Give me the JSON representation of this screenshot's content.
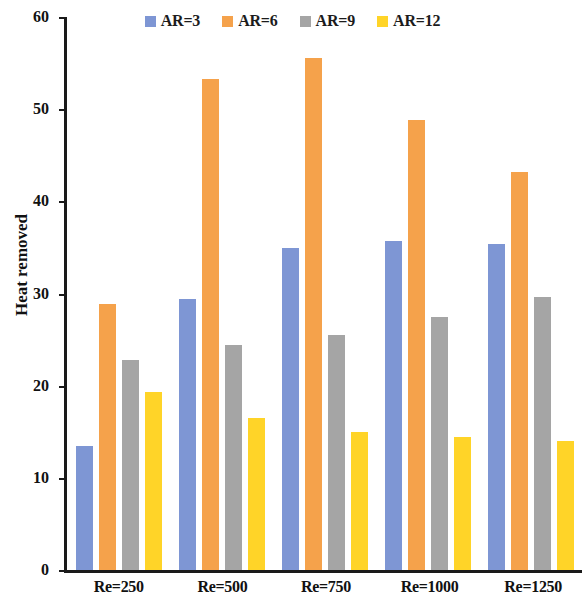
{
  "chart_data": {
    "type": "bar",
    "title": "",
    "xlabel": "",
    "ylabel": "Heat removed",
    "ylim": [
      0,
      60
    ],
    "yticks": [
      0,
      10,
      20,
      30,
      40,
      50,
      60
    ],
    "grid": false,
    "legend_position": "top-center",
    "categories": [
      "Re=250",
      "Re=500",
      "Re=750",
      "Re=1000",
      "Re=1250"
    ],
    "series": [
      {
        "name": "AR=3",
        "color": "#7E96D4",
        "values": [
          13.5,
          29.4,
          34.9,
          35.7,
          35.4
        ]
      },
      {
        "name": "AR=6",
        "color": "#F5A24B",
        "values": [
          28.9,
          53.3,
          55.6,
          48.8,
          43.2
        ]
      },
      {
        "name": "AR=9",
        "color": "#A5A5A5",
        "values": [
          22.8,
          24.4,
          25.5,
          27.5,
          29.6
        ]
      },
      {
        "name": "AR=12",
        "color": "#FFD428",
        "values": [
          19.3,
          16.5,
          15.0,
          14.4,
          14.0
        ]
      }
    ]
  },
  "axis": {
    "tick_labels": [
      "0",
      "10",
      "20",
      "30",
      "40",
      "50",
      "60"
    ],
    "y_title": "Heat removed"
  },
  "legend": {
    "items": [
      {
        "label": "AR=3",
        "color": "#7E96D4"
      },
      {
        "label": "AR=6",
        "color": "#F5A24B"
      },
      {
        "label": "AR=9",
        "color": "#A5A5A5"
      },
      {
        "label": "AR=12",
        "color": "#FFD428"
      }
    ]
  }
}
